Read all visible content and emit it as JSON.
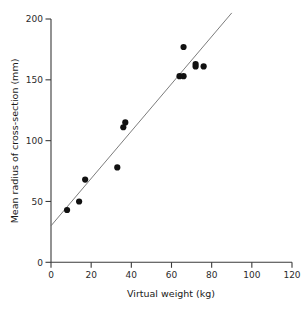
{
  "chart_data": {
    "type": "scatter",
    "title": "",
    "xlabel": "Virtual weight (kg)",
    "ylabel": "Mean radius of cross-section (mm)",
    "xlim": [
      0,
      120
    ],
    "ylim": [
      0,
      200
    ],
    "xticks": [
      0,
      20,
      40,
      60,
      80,
      100,
      120
    ],
    "yticks": [
      0,
      50,
      100,
      150,
      200
    ],
    "xtick_labels": [
      "0",
      "20",
      "40",
      "60",
      "80",
      "100",
      "120"
    ],
    "ytick_labels": [
      "0",
      "50",
      "100",
      "150",
      "200"
    ],
    "grid": false,
    "legend": "none",
    "marker": "filled-circle",
    "marker_color": "#111111",
    "points": [
      {
        "x": 8,
        "y": 43
      },
      {
        "x": 14,
        "y": 50
      },
      {
        "x": 17,
        "y": 68
      },
      {
        "x": 33,
        "y": 78
      },
      {
        "x": 36,
        "y": 111
      },
      {
        "x": 37,
        "y": 115
      },
      {
        "x": 64,
        "y": 153
      },
      {
        "x": 66,
        "y": 153
      },
      {
        "x": 66,
        "y": 177
      },
      {
        "x": 72,
        "y": 161
      },
      {
        "x": 72,
        "y": 163
      },
      {
        "x": 76,
        "y": 161
      }
    ],
    "fit_line": {
      "type": "linear-regression",
      "x_start": 0,
      "y_start": 30,
      "x_end": 90,
      "y_end": 205,
      "color": "#6d6d6d"
    }
  }
}
